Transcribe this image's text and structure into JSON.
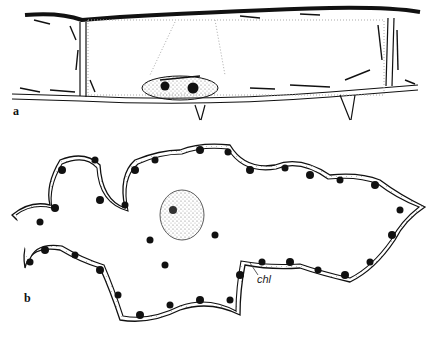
{
  "figure": {
    "panels": [
      {
        "id": "a",
        "label": "a",
        "description": "Elongated cell with cytoplasmic strands, nucleus with two nucleoli, and chloroplasts along cell walls"
      },
      {
        "id": "b",
        "label": "b",
        "description": "Lobed mesophyll cell with wavy cell walls, chloroplasts lining the periphery, and central nucleus"
      }
    ],
    "annotations": [
      {
        "text": "chl",
        "panel": "b",
        "meaning": "chloroplast"
      }
    ],
    "colors": {
      "ink": "#111111",
      "stipple": "#9a9a9a",
      "background": "#ffffff"
    }
  }
}
